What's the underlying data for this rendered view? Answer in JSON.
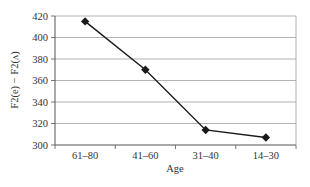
{
  "chart_data": {
    "type": "line",
    "title": "",
    "xlabel": "Age",
    "ylabel": "F2(e) − F2(ʌ)",
    "categories": [
      "61–80",
      "41–60",
      "31–40",
      "14–30"
    ],
    "series": [
      {
        "name": "F2(e) − F2(ʌ)",
        "values": [
          415,
          370,
          314,
          307
        ],
        "marker": "diamond",
        "color": "#1a1a1a"
      }
    ],
    "ylim": [
      300,
      420
    ],
    "yticks": [
      300,
      320,
      340,
      360,
      380,
      400,
      420
    ],
    "grid": true,
    "legend": "none"
  },
  "colors": {
    "line": "#1a1a1a",
    "grid": "#a0a0a0",
    "axis": "#555555",
    "text": "#333333"
  }
}
